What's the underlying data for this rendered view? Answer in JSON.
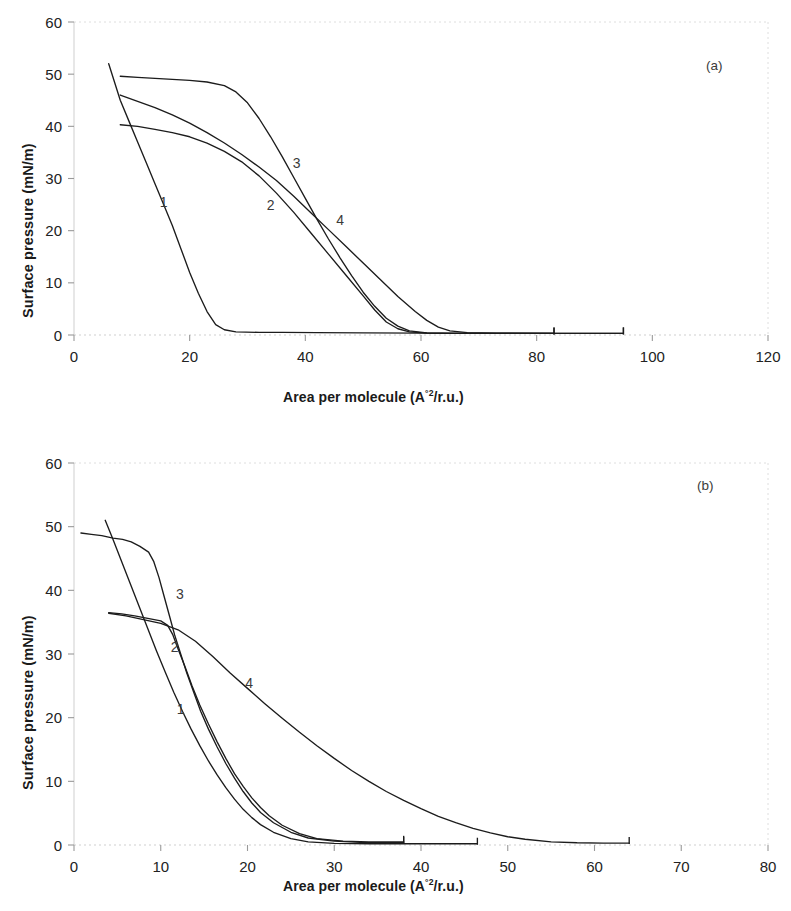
{
  "figure": {
    "background": "#ffffff",
    "line_color": "#1c1c1c",
    "axis_color": "#b8b8b8",
    "tick_text_color": "#222222"
  },
  "panels": [
    {
      "id": "a",
      "tag": "(a)",
      "ylabel": "Surface pressure (mN/m)",
      "xlabel_pre": "Area per molecule (A",
      "xlabel_sup": "°2",
      "xlabel_post": "/r.u.)",
      "xticks": [
        0,
        20,
        40,
        60,
        80,
        100,
        120
      ],
      "yticks": [
        0,
        10,
        20,
        30,
        40,
        50,
        60
      ],
      "curve_labels": [
        {
          "text": "1",
          "x": 15.5,
          "y": 24.5
        },
        {
          "text": "2",
          "x": 34.0,
          "y": 24.0
        },
        {
          "text": "3",
          "x": 38.5,
          "y": 32.0
        },
        {
          "text": "4",
          "x": 46.0,
          "y": 21.0
        }
      ]
    },
    {
      "id": "b",
      "tag": "(b)",
      "ylabel": "Surface pressure (mN/m)",
      "xlabel_pre": "Area per molecule (A",
      "xlabel_sup": "°2",
      "xlabel_post": "/r.u.)",
      "xticks": [
        0,
        10,
        20,
        30,
        40,
        50,
        60,
        70,
        80
      ],
      "yticks": [
        0,
        10,
        20,
        30,
        40,
        50,
        60
      ],
      "curve_labels": [
        {
          "text": "1",
          "x": 12.3,
          "y": 20.5
        },
        {
          "text": "2",
          "x": 11.6,
          "y": 30.3
        },
        {
          "text": "3",
          "x": 12.2,
          "y": 38.6
        },
        {
          "text": "4",
          "x": 20.2,
          "y": 24.6
        }
      ]
    }
  ],
  "chart_data": [
    {
      "type": "line",
      "title": "(a)",
      "xlabel": "Area per molecule (A°2/r.u.)",
      "ylabel": "Surface pressure (mN/m)",
      "xlim": [
        0,
        120
      ],
      "ylim": [
        0,
        60
      ],
      "xticks": [
        0,
        20,
        40,
        60,
        80,
        100,
        120
      ],
      "yticks": [
        0,
        10,
        20,
        30,
        40,
        50,
        60
      ],
      "grid": false,
      "legend": "inline curve numbers",
      "series": [
        {
          "name": "1",
          "points": [
            [
              6.0,
              52.0
            ],
            [
              7.0,
              48.5
            ],
            [
              8.0,
              45.0
            ],
            [
              9.5,
              41.0
            ],
            [
              11.0,
              37.0
            ],
            [
              12.5,
              33.0
            ],
            [
              14.0,
              29.0
            ],
            [
              15.5,
              25.0
            ],
            [
              17.0,
              21.0
            ],
            [
              18.5,
              16.5
            ],
            [
              20.0,
              12.0
            ],
            [
              21.5,
              8.0
            ],
            [
              23.0,
              4.5
            ],
            [
              24.5,
              2.0
            ],
            [
              26.0,
              1.0
            ],
            [
              28.0,
              0.6
            ],
            [
              32.0,
              0.5
            ],
            [
              36.0,
              0.5
            ],
            [
              42.0,
              0.45
            ],
            [
              50.0,
              0.4
            ],
            [
              60.0,
              0.35
            ],
            [
              70.0,
              0.3
            ],
            [
              83.0,
              0.3
            ],
            [
              95.0,
              0.3
            ]
          ]
        },
        {
          "name": "2",
          "points": [
            [
              8.0,
              40.3
            ],
            [
              11.0,
              40.0
            ],
            [
              14.0,
              39.4
            ],
            [
              17.0,
              38.8
            ],
            [
              20.0,
              38.0
            ],
            [
              23.0,
              36.8
            ],
            [
              26.0,
              35.2
            ],
            [
              29.0,
              33.2
            ],
            [
              32.0,
              30.5
            ],
            [
              35.0,
              27.2
            ],
            [
              38.0,
              23.5
            ],
            [
              41.0,
              19.5
            ],
            [
              44.0,
              15.5
            ],
            [
              47.0,
              11.5
            ],
            [
              50.0,
              7.5
            ],
            [
              52.0,
              4.8
            ],
            [
              54.0,
              2.5
            ],
            [
              56.0,
              1.2
            ],
            [
              58.0,
              0.6
            ],
            [
              61.0,
              0.35
            ],
            [
              66.0,
              0.3
            ],
            [
              75.0,
              0.3
            ],
            [
              83.0,
              0.3
            ]
          ]
        },
        {
          "name": "3",
          "points": [
            [
              8.0,
              49.6
            ],
            [
              11.0,
              49.4
            ],
            [
              14.0,
              49.2
            ],
            [
              17.0,
              49.0
            ],
            [
              20.0,
              48.8
            ],
            [
              23.0,
              48.5
            ],
            [
              26.0,
              47.8
            ],
            [
              28.0,
              46.6
            ],
            [
              30.0,
              44.5
            ],
            [
              32.0,
              41.5
            ],
            [
              34.0,
              38.0
            ],
            [
              36.0,
              34.2
            ],
            [
              38.0,
              30.2
            ],
            [
              40.0,
              26.2
            ],
            [
              42.0,
              22.2
            ],
            [
              44.0,
              18.4
            ],
            [
              46.0,
              14.8
            ],
            [
              48.0,
              11.4
            ],
            [
              50.0,
              8.2
            ],
            [
              52.0,
              5.5
            ],
            [
              54.0,
              3.2
            ],
            [
              56.0,
              1.7
            ],
            [
              58.0,
              0.8
            ],
            [
              61.0,
              0.4
            ],
            [
              66.0,
              0.3
            ],
            [
              75.0,
              0.3
            ],
            [
              83.0,
              0.3
            ]
          ]
        },
        {
          "name": "4",
          "points": [
            [
              8.0,
              46.0
            ],
            [
              11.0,
              44.8
            ],
            [
              14.0,
              43.6
            ],
            [
              17.0,
              42.2
            ],
            [
              20.0,
              40.6
            ],
            [
              23.0,
              38.8
            ],
            [
              26.0,
              36.8
            ],
            [
              29.0,
              34.6
            ],
            [
              32.0,
              32.2
            ],
            [
              35.0,
              29.6
            ],
            [
              38.0,
              26.6
            ],
            [
              41.0,
              23.4
            ],
            [
              44.0,
              20.2
            ],
            [
              47.0,
              17.0
            ],
            [
              50.0,
              13.8
            ],
            [
              53.0,
              10.6
            ],
            [
              56.0,
              7.4
            ],
            [
              59.0,
              4.5
            ],
            [
              61.0,
              2.8
            ],
            [
              63.0,
              1.5
            ],
            [
              65.0,
              0.8
            ],
            [
              68.0,
              0.45
            ],
            [
              73.0,
              0.35
            ],
            [
              83.0,
              0.3
            ],
            [
              95.0,
              0.3
            ]
          ]
        }
      ]
    },
    {
      "type": "line",
      "title": "(b)",
      "xlabel": "Area per molecule (A°2/r.u.)",
      "ylabel": "Surface pressure (mN/m)",
      "xlim": [
        0,
        80
      ],
      "ylim": [
        0,
        60
      ],
      "xticks": [
        0,
        10,
        20,
        30,
        40,
        50,
        60,
        70,
        80
      ],
      "yticks": [
        0,
        10,
        20,
        30,
        40,
        50,
        60
      ],
      "grid": false,
      "legend": "inline curve numbers",
      "series": [
        {
          "name": "1",
          "points": [
            [
              3.6,
              51.0
            ],
            [
              4.5,
              48.0
            ],
            [
              5.5,
              44.5
            ],
            [
              6.5,
              41.0
            ],
            [
              7.5,
              37.5
            ],
            [
              8.5,
              34.0
            ],
            [
              9.5,
              30.5
            ],
            [
              10.5,
              27.2
            ],
            [
              11.5,
              24.0
            ],
            [
              12.5,
              21.0
            ],
            [
              13.5,
              18.2
            ],
            [
              14.5,
              15.6
            ],
            [
              15.5,
              13.2
            ],
            [
              16.5,
              11.0
            ],
            [
              17.5,
              9.0
            ],
            [
              18.5,
              7.2
            ],
            [
              19.5,
              5.6
            ],
            [
              20.5,
              4.3
            ],
            [
              21.5,
              3.2
            ],
            [
              23.0,
              2.0
            ],
            [
              25.0,
              1.0
            ],
            [
              27.0,
              0.5
            ],
            [
              30.0,
              0.25
            ],
            [
              34.0,
              0.2
            ],
            [
              38.0,
              0.2
            ],
            [
              42.0,
              0.2
            ],
            [
              46.5,
              0.2
            ]
          ]
        },
        {
          "name": "2",
          "points": [
            [
              4.0,
              36.5
            ],
            [
              5.5,
              36.3
            ],
            [
              7.0,
              36.0
            ],
            [
              8.5,
              35.6
            ],
            [
              10.0,
              35.2
            ],
            [
              10.8,
              34.5
            ],
            [
              11.4,
              33.0
            ],
            [
              12.0,
              30.8
            ],
            [
              12.8,
              28.0
            ],
            [
              13.6,
              25.0
            ],
            [
              14.5,
              22.0
            ],
            [
              15.5,
              19.0
            ],
            [
              16.5,
              16.2
            ],
            [
              17.5,
              13.6
            ],
            [
              18.5,
              11.2
            ],
            [
              19.5,
              9.2
            ],
            [
              20.5,
              7.4
            ],
            [
              21.5,
              5.9
            ],
            [
              22.5,
              4.6
            ],
            [
              24.0,
              3.1
            ],
            [
              26.0,
              1.8
            ],
            [
              28.0,
              1.0
            ],
            [
              31.0,
              0.6
            ],
            [
              34.0,
              0.5
            ],
            [
              37.0,
              0.5
            ],
            [
              38.0,
              0.5
            ]
          ]
        },
        {
          "name": "3",
          "points": [
            [
              0.8,
              49.0
            ],
            [
              2.0,
              48.8
            ],
            [
              3.2,
              48.6
            ],
            [
              4.5,
              48.2
            ],
            [
              5.6,
              48.0
            ],
            [
              6.6,
              47.6
            ],
            [
              7.6,
              46.9
            ],
            [
              8.6,
              46.0
            ],
            [
              9.2,
              44.5
            ],
            [
              9.8,
              42.0
            ],
            [
              10.4,
              39.0
            ],
            [
              11.0,
              36.0
            ],
            [
              11.6,
              33.0
            ],
            [
              12.3,
              30.0
            ],
            [
              13.0,
              27.0
            ],
            [
              13.8,
              24.0
            ],
            [
              14.6,
              21.0
            ],
            [
              15.5,
              18.2
            ],
            [
              16.5,
              15.4
            ],
            [
              17.5,
              12.8
            ],
            [
              18.5,
              10.5
            ],
            [
              19.5,
              8.4
            ],
            [
              20.5,
              6.6
            ],
            [
              21.5,
              5.1
            ],
            [
              23.0,
              3.5
            ],
            [
              25.0,
              2.0
            ],
            [
              27.0,
              1.1
            ],
            [
              30.0,
              0.6
            ],
            [
              33.0,
              0.4
            ],
            [
              36.0,
              0.35
            ],
            [
              38.0,
              0.35
            ]
          ]
        },
        {
          "name": "4",
          "points": [
            [
              4.0,
              36.4
            ],
            [
              6.0,
              36.0
            ],
            [
              8.0,
              35.4
            ],
            [
              10.0,
              34.8
            ],
            [
              12.0,
              33.8
            ],
            [
              14.0,
              32.0
            ],
            [
              16.0,
              29.6
            ],
            [
              18.0,
              27.0
            ],
            [
              20.0,
              24.6
            ],
            [
              22.0,
              22.2
            ],
            [
              24.0,
              19.9
            ],
            [
              26.0,
              17.7
            ],
            [
              28.0,
              15.6
            ],
            [
              30.0,
              13.6
            ],
            [
              32.0,
              11.7
            ],
            [
              34.0,
              10.0
            ],
            [
              36.0,
              8.4
            ],
            [
              38.0,
              7.0
            ],
            [
              40.0,
              5.7
            ],
            [
              42.0,
              4.5
            ],
            [
              44.0,
              3.5
            ],
            [
              46.0,
              2.6
            ],
            [
              48.0,
              1.9
            ],
            [
              50.0,
              1.3
            ],
            [
              52.0,
              0.9
            ],
            [
              55.0,
              0.5
            ],
            [
              58.0,
              0.35
            ],
            [
              61.0,
              0.3
            ],
            [
              64.0,
              0.3
            ]
          ]
        }
      ]
    }
  ]
}
